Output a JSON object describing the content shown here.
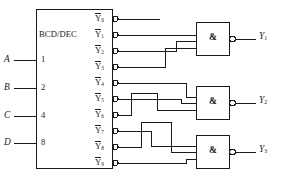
{
  "diagram": {
    "type": "logic-circuit-schematic",
    "line_color": "#1a1a1a",
    "background": "#ffffff"
  },
  "decoder": {
    "label": "BCD/DEC",
    "inputs": [
      {
        "name": "A",
        "weight": "1"
      },
      {
        "name": "B",
        "weight": "2"
      },
      {
        "name": "C",
        "weight": "4"
      },
      {
        "name": "D",
        "weight": "8"
      }
    ],
    "outputs": [
      {
        "base": "Y",
        "index": "0",
        "overbar": true
      },
      {
        "base": "Y",
        "index": "1",
        "overbar": true
      },
      {
        "base": "Y",
        "index": "2",
        "overbar": true
      },
      {
        "base": "Y",
        "index": "3",
        "overbar": true
      },
      {
        "base": "Y",
        "index": "4",
        "overbar": true
      },
      {
        "base": "Y",
        "index": "5",
        "overbar": true
      },
      {
        "base": "Y",
        "index": "6",
        "overbar": true
      },
      {
        "base": "Y",
        "index": "7",
        "overbar": true
      },
      {
        "base": "Y",
        "index": "8",
        "overbar": true
      },
      {
        "base": "Y",
        "index": "9",
        "overbar": true
      }
    ]
  },
  "gates": [
    {
      "symbol": "&",
      "kind": "nand",
      "inverted_output": true,
      "output_label": "Y",
      "output_index": "1",
      "input_count": 3
    },
    {
      "symbol": "&",
      "kind": "nand",
      "inverted_output": true,
      "output_label": "Y",
      "output_index": "2",
      "input_count": 3
    },
    {
      "symbol": "&",
      "kind": "nand",
      "inverted_output": true,
      "output_label": "Y",
      "output_index": "3",
      "input_count": 3
    }
  ],
  "outputs": [
    {
      "base": "Y",
      "index": "1"
    },
    {
      "base": "Y",
      "index": "2"
    },
    {
      "base": "Y",
      "index": "3"
    }
  ]
}
